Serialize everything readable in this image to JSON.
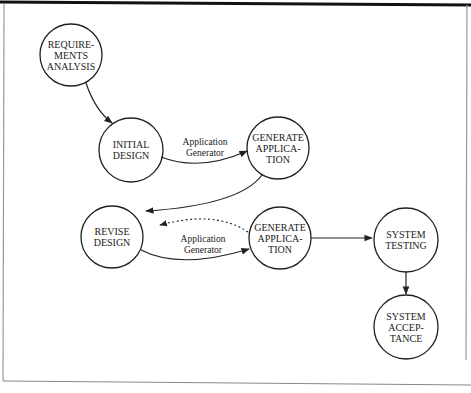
{
  "diagram": {
    "type": "flow",
    "nodes": [
      {
        "id": "requirements",
        "label": "REQUIRE-\nMENTS\nANALYSIS"
      },
      {
        "id": "initial_design",
        "label": "INITIAL\nDESIGN"
      },
      {
        "id": "generate_app_1",
        "label": "GENERATE\nAPPLICA-\nTION"
      },
      {
        "id": "revise_design",
        "label": "REVISE\nDESIGN"
      },
      {
        "id": "generate_app_2",
        "label": "GENERATE\nAPPLICA-\nTION"
      },
      {
        "id": "system_testing",
        "label": "SYSTEM\nTESTING"
      },
      {
        "id": "system_acceptance",
        "label": "SYSTEM\nACCEP-\nTANCE"
      }
    ],
    "edges": [
      {
        "from": "requirements",
        "to": "initial_design",
        "label": "",
        "style": "solid"
      },
      {
        "from": "initial_design",
        "to": "generate_app_1",
        "label": "Application\nGenerator",
        "style": "solid"
      },
      {
        "from": "generate_app_1",
        "to": "revise_design",
        "label": "",
        "style": "solid"
      },
      {
        "from": "revise_design",
        "to": "generate_app_2",
        "label": "Application\nGenerator",
        "style": "solid"
      },
      {
        "from": "generate_app_2",
        "to": "revise_design",
        "label": "",
        "style": "dotted"
      },
      {
        "from": "generate_app_2",
        "to": "system_testing",
        "label": "",
        "style": "solid"
      },
      {
        "from": "system_testing",
        "to": "system_acceptance",
        "label": "",
        "style": "solid"
      }
    ],
    "edge_labels": {
      "upper": "Application Generator",
      "lower": "Application Generator"
    },
    "colors": {
      "stroke": "#222222",
      "frame": "#888888",
      "top_bar": "#111111",
      "background": "#ffffff"
    }
  }
}
